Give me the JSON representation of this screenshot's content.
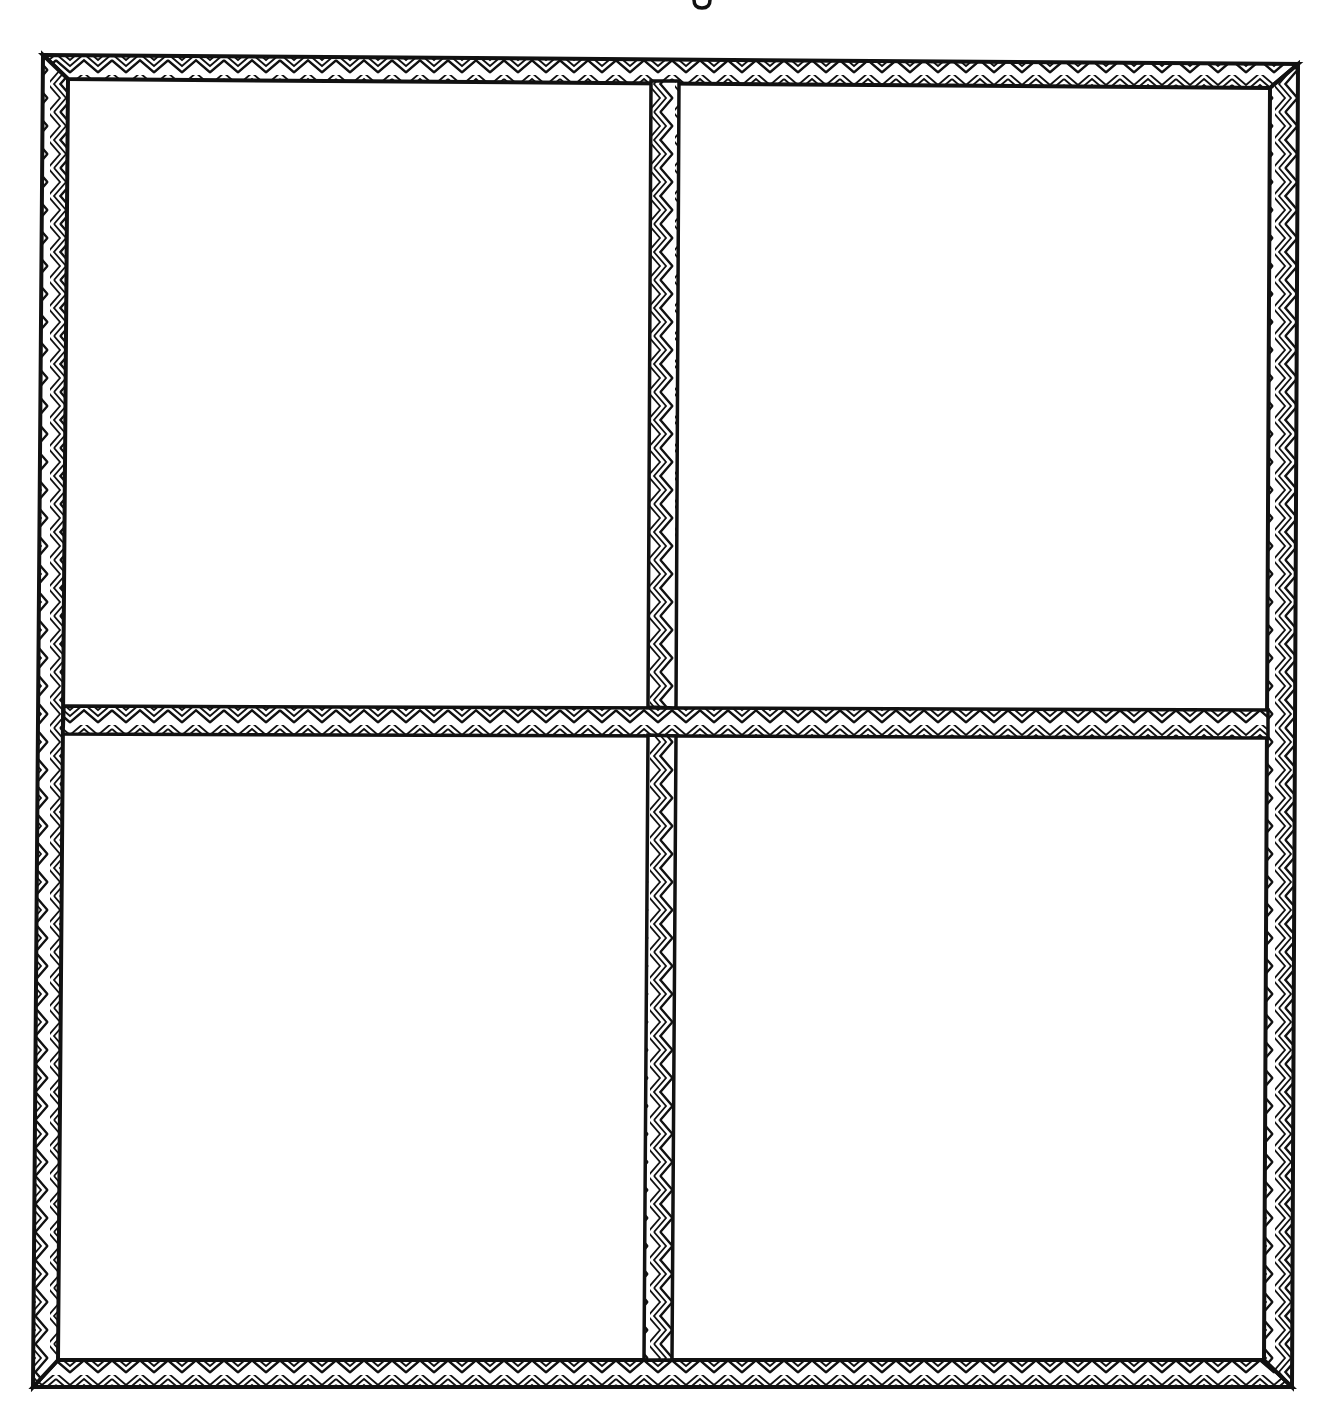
{
  "canvas": {
    "width": 1330,
    "height": 1414,
    "background": "#ffffff",
    "ink_color": "#111111"
  },
  "title": {
    "text": "",
    "note": "cut off at top edge; only a descender fragment visible"
  },
  "diagram": {
    "type": "window-frame",
    "border_pattern": "nested-chevron-zigzag",
    "band_thickness_px": 25,
    "panes": [
      {
        "id": "top-left",
        "label": ""
      },
      {
        "id": "top-right",
        "label": ""
      },
      {
        "id": "bottom-left",
        "label": ""
      },
      {
        "id": "bottom-right",
        "label": ""
      }
    ]
  }
}
